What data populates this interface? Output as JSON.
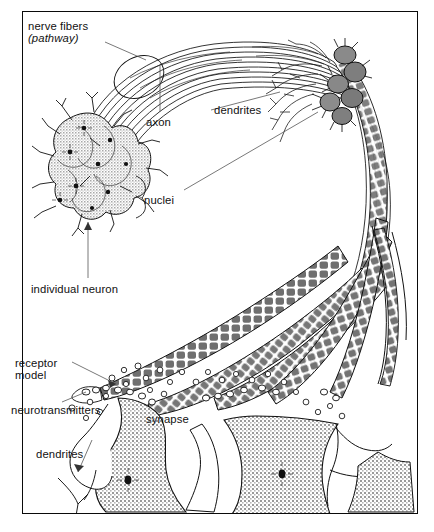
{
  "figure": {
    "background_color": "#ffffff",
    "border_color": "#0a0a0a",
    "ink_color": "#111111"
  },
  "labels": {
    "nerve_fibers": "nerve fibers",
    "pathway": "(pathway)",
    "axon": "axon",
    "dendrites_top": "dendrites",
    "nuclei": "nuclei",
    "individual_neuron": "individual neuron",
    "receptor": "receptor",
    "model": "model",
    "neurotransmitters": "neurotransmitters",
    "synapse": "synapse",
    "dendrites_bottom": "dendrites"
  },
  "structures": {
    "fiber_bundle": "nerve fiber tract arcing from upper-left cell cluster over the top and down the right side",
    "upper_left_cluster": "cluster of eight stippled star-shaped neuron cell bodies with dark nuclei",
    "upper_right_cluster": "four dark gray filled neuron cell bodies with spiky dendrites",
    "myelinated_axons": "segmented (myelin sheath) axon terminals fanning toward the lower synapse field",
    "vesicles": "small open circles representing neurotransmitter molecules in the synaptic cleft",
    "postsynaptic_cells": "two large stippled cell bodies at the bottom with dark nuclei"
  },
  "colors": {
    "cell_fill_light": "#d8d8d8",
    "cell_fill_dark": "#8a8a8a",
    "stipple": "#9a9a9a",
    "nucleus": "#111111"
  }
}
